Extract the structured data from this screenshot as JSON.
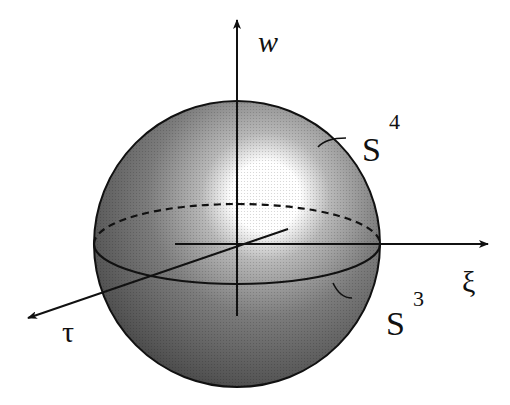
{
  "diagram": {
    "sphere_label": "S",
    "sphere_label_sup": "4",
    "equator_label": "S",
    "equator_label_sup": "3",
    "axes": {
      "vertical": "w",
      "horizontal": "ξ",
      "depth": "τ"
    },
    "colors": {
      "sphere_dark": "#3a3a3a",
      "sphere_mid": "#8a8a8a",
      "highlight": "#ffffff",
      "ink": "#111111",
      "background": "#ffffff"
    }
  }
}
